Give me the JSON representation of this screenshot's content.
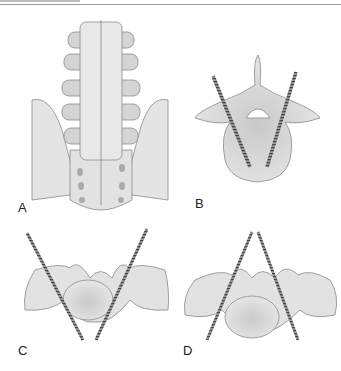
{
  "figure": {
    "header_rule": true,
    "panels": [
      {
        "id": "A",
        "label": "A",
        "description": "posterior view of lumbar spine and sacrum"
      },
      {
        "id": "B",
        "label": "B",
        "description": "axial vertebra with two converging pedicle screws"
      },
      {
        "id": "C",
        "label": "C",
        "description": "axial sacrum with two diverging screws"
      },
      {
        "id": "D",
        "label": "D",
        "description": "axial sacrum with two crossing screws"
      }
    ],
    "colors": {
      "bone": "#e2e2e2",
      "bone_dark": "#c4c4c4",
      "outline": "#8a8a8a",
      "screw": "#9a9a9a",
      "screw_thread": "#555555"
    }
  }
}
